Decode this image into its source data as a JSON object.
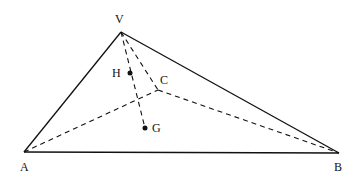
{
  "diagram": {
    "type": "tetrahedron",
    "points": {
      "V": {
        "label": "V",
        "x": 121,
        "y": 32
      },
      "A": {
        "label": "A",
        "x": 24,
        "y": 152
      },
      "B": {
        "label": "B",
        "x": 339,
        "y": 153
      },
      "C": {
        "label": "C",
        "x": 158,
        "y": 90
      },
      "H": {
        "label": "H",
        "x": 130,
        "y": 73
      },
      "G": {
        "label": "G",
        "x": 145,
        "y": 128
      }
    },
    "solid_edges": [
      "VA",
      "VB",
      "AB"
    ],
    "dashed_edges": [
      "VC",
      "AC",
      "CB",
      "VG"
    ]
  }
}
